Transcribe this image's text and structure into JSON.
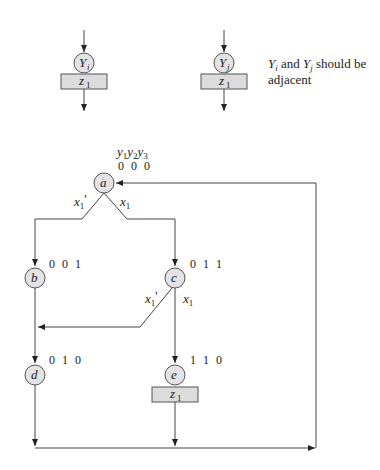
{
  "legend": {
    "left_state": "Y",
    "left_state_sub": "i",
    "right_state": "Y",
    "right_state_sub": "j",
    "output_z": "z",
    "output_sub": "1",
    "note_line1_a": "Y",
    "note_line1_a_sub": "i",
    "note_line1_b": " and ",
    "note_line1_c": "Y",
    "note_line1_c_sub": "j",
    "note_line1_d": " should be",
    "note_line2": "adjacent"
  },
  "header": {
    "y": "y",
    "sub1": "1",
    "sub2": "2",
    "sub3": "3"
  },
  "states": [
    {
      "name": "a",
      "code": "0 0 0"
    },
    {
      "name": "b",
      "code": "0 0 1"
    },
    {
      "name": "c",
      "code": "0 1 1"
    },
    {
      "name": "d",
      "code": "0 1 0"
    },
    {
      "name": "e",
      "code": "1 1 0"
    }
  ],
  "transitions": {
    "x": "x",
    "x_sub": "1",
    "prime": "'"
  },
  "output_box": {
    "z": "z",
    "sub": "1"
  }
}
